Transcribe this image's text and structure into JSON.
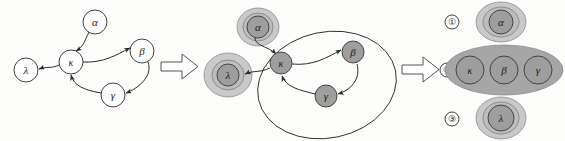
{
  "figure": {
    "width": 565,
    "height": 141,
    "background_color": "#fdfdfc"
  },
  "colors": {
    "stroke": "#2b2b2b",
    "node_plain_fill": "#ffffff",
    "node_shaded_fill": "#9e9e9e",
    "halo_outer_fill": "#c9c9c9",
    "halo_inner_fill": "#bdbdbd",
    "group_blob_fill": "#a6a6a6",
    "arrow_fill": "#ffffff",
    "arrow_stroke": "#555555"
  },
  "panels": [
    {
      "id": "panel-1",
      "name": "original-digraph",
      "style": "plain",
      "nodes": [
        {
          "id": "alpha",
          "label": "α",
          "cx": 95,
          "cy": 22,
          "r": 12
        },
        {
          "id": "kappa",
          "label": "κ",
          "cx": 71,
          "cy": 62,
          "r": 12
        },
        {
          "id": "lambda",
          "label": "λ",
          "cx": 26,
          "cy": 70,
          "r": 12
        },
        {
          "id": "beta",
          "label": "β",
          "cx": 142,
          "cy": 51,
          "r": 12
        },
        {
          "id": "gamma",
          "label": "γ",
          "cx": 113,
          "cy": 95,
          "r": 12
        }
      ],
      "edges": [
        {
          "from": "alpha",
          "to": "kappa"
        },
        {
          "from": "kappa",
          "to": "lambda"
        },
        {
          "from": "kappa",
          "to": "beta"
        },
        {
          "from": "beta",
          "to": "gamma"
        },
        {
          "from": "gamma",
          "to": "kappa"
        }
      ]
    },
    {
      "id": "panel-2",
      "name": "components-highlighted-digraph",
      "style": "shaded",
      "nodes": [
        {
          "id": "alpha",
          "label": "α",
          "cx": 258,
          "cy": 27,
          "r": 11
        },
        {
          "id": "kappa",
          "label": "κ",
          "cx": 281,
          "cy": 63,
          "r": 11
        },
        {
          "id": "lambda",
          "label": "λ",
          "cx": 228,
          "cy": 75,
          "r": 11
        },
        {
          "id": "beta",
          "label": "β",
          "cx": 353,
          "cy": 52,
          "r": 11
        },
        {
          "id": "gamma",
          "label": "γ",
          "cx": 326,
          "cy": 96,
          "r": 11
        }
      ],
      "edges": [
        {
          "from": "alpha",
          "to": "kappa"
        },
        {
          "from": "kappa",
          "to": "lambda"
        },
        {
          "from": "kappa",
          "to": "beta"
        },
        {
          "from": "beta",
          "to": "gamma"
        },
        {
          "from": "gamma",
          "to": "kappa"
        }
      ],
      "component_rings": [
        {
          "for": "alpha",
          "cx": 258,
          "cy": 27,
          "rx": 21,
          "ry": 19
        },
        {
          "for": "lambda",
          "cx": 228,
          "cy": 75,
          "rx": 24,
          "ry": 22
        }
      ],
      "component_outlines": [
        {
          "id": "cycle-ellipse",
          "cx": 327,
          "cy": 85,
          "rx": 70,
          "ry": 53,
          "rotate": -12
        }
      ]
    },
    {
      "id": "panel-3",
      "name": "condensation-components",
      "style": "grouped",
      "groups": [
        {
          "index": "①",
          "index_cx": 452,
          "index_cy": 22,
          "shape": {
            "cx": 501,
            "cy": 22,
            "rx": 25,
            "ry": 20
          },
          "members": [
            {
              "id": "alpha",
              "label": "α",
              "cx": 501,
              "cy": 22,
              "r": 12
            }
          ]
        },
        {
          "index": "②",
          "index_cx": 447,
          "index_cy": 70,
          "shape": {
            "cx": 504,
            "cy": 70,
            "rx": 59,
            "ry": 25
          },
          "members": [
            {
              "id": "kappa",
              "label": "κ",
              "cx": 470,
              "cy": 70,
              "r": 14
            },
            {
              "id": "beta",
              "label": "β",
              "cx": 504,
              "cy": 70,
              "r": 14
            },
            {
              "id": "gamma",
              "label": "γ",
              "cx": 538,
              "cy": 70,
              "r": 14
            }
          ]
        },
        {
          "index": "③",
          "index_cx": 452,
          "index_cy": 119,
          "shape": {
            "cx": 501,
            "cy": 118,
            "rx": 25,
            "ry": 21
          },
          "members": [
            {
              "id": "lambda",
              "label": "λ",
              "cx": 501,
              "cy": 118,
              "r": 13
            }
          ]
        }
      ]
    }
  ],
  "transition_arrows": [
    {
      "id": "arrow-1",
      "name": "transition-arrow-left",
      "x": 161,
      "y": 54,
      "w": 37,
      "h": 25
    },
    {
      "id": "arrow-2",
      "name": "transition-arrow-right",
      "x": 402,
      "y": 57,
      "w": 37,
      "h": 25
    }
  ]
}
